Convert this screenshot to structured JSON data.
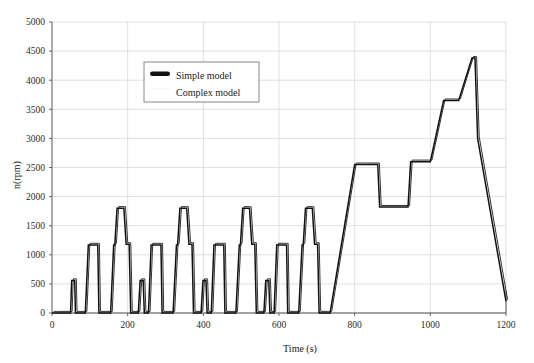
{
  "chart_data": {
    "type": "line",
    "title": "",
    "xlabel": "Time (s)",
    "ylabel": "n(rpm)",
    "xlim": [
      0,
      1200
    ],
    "ylim": [
      0,
      5000
    ],
    "xticks": [
      0,
      200,
      400,
      600,
      800,
      1000,
      1200
    ],
    "yticks": [
      0,
      500,
      1000,
      1500,
      2000,
      2500,
      3000,
      3500,
      4000,
      4500,
      5000
    ],
    "grid": true,
    "legend_position": "upper-left-inside",
    "colors": {
      "simple_model": "#111111",
      "complex_model": "#333333",
      "grid": "#d8d8da",
      "axis": "#555555"
    },
    "series": [
      {
        "name": "Simple model",
        "marker": "thick-line",
        "points": [
          [
            0,
            0
          ],
          [
            10,
            0
          ],
          [
            11,
            0
          ],
          [
            49,
            0
          ],
          [
            52,
            560
          ],
          [
            57,
            560
          ],
          [
            60,
            560
          ],
          [
            62,
            0
          ],
          [
            85,
            0
          ],
          [
            88,
            0
          ],
          [
            96,
            1170
          ],
          [
            118,
            1170
          ],
          [
            121,
            1170
          ],
          [
            124,
            0
          ],
          [
            150,
            0
          ],
          [
            155,
            0
          ],
          [
            163,
            1170
          ],
          [
            166,
            1170
          ],
          [
            172,
            1800
          ],
          [
            186,
            1800
          ],
          [
            190,
            1800
          ],
          [
            196,
            1180
          ],
          [
            200,
            1180
          ],
          [
            204,
            1180
          ],
          [
            208,
            0
          ],
          [
            225,
            0
          ],
          [
            228,
            0
          ],
          [
            233,
            560
          ],
          [
            238,
            560
          ],
          [
            241,
            560
          ],
          [
            244,
            0
          ],
          [
            250,
            0
          ],
          [
            255,
            0
          ],
          [
            262,
            1170
          ],
          [
            284,
            1170
          ],
          [
            288,
            1170
          ],
          [
            291,
            0
          ],
          [
            316,
            0
          ],
          [
            320,
            0
          ],
          [
            329,
            1170
          ],
          [
            332,
            1170
          ],
          [
            338,
            1800
          ],
          [
            352,
            1800
          ],
          [
            356,
            1800
          ],
          [
            362,
            1180
          ],
          [
            366,
            1180
          ],
          [
            370,
            1180
          ],
          [
            374,
            0
          ],
          [
            391,
            0
          ],
          [
            394,
            0
          ],
          [
            399,
            560
          ],
          [
            404,
            560
          ],
          [
            407,
            560
          ],
          [
            410,
            0
          ],
          [
            416,
            0
          ],
          [
            421,
            0
          ],
          [
            428,
            1170
          ],
          [
            450,
            1170
          ],
          [
            454,
            1170
          ],
          [
            457,
            0
          ],
          [
            482,
            0
          ],
          [
            486,
            0
          ],
          [
            495,
            1170
          ],
          [
            498,
            1170
          ],
          [
            504,
            1800
          ],
          [
            518,
            1800
          ],
          [
            522,
            1800
          ],
          [
            528,
            1180
          ],
          [
            532,
            1180
          ],
          [
            536,
            1180
          ],
          [
            540,
            0
          ],
          [
            557,
            0
          ],
          [
            560,
            0
          ],
          [
            565,
            560
          ],
          [
            570,
            560
          ],
          [
            573,
            560
          ],
          [
            576,
            0
          ],
          [
            582,
            0
          ],
          [
            587,
            0
          ],
          [
            594,
            1170
          ],
          [
            616,
            1170
          ],
          [
            620,
            1170
          ],
          [
            623,
            0
          ],
          [
            648,
            0
          ],
          [
            652,
            0
          ],
          [
            661,
            1170
          ],
          [
            664,
            1170
          ],
          [
            670,
            1800
          ],
          [
            684,
            1800
          ],
          [
            688,
            1800
          ],
          [
            694,
            1180
          ],
          [
            698,
            1180
          ],
          [
            702,
            1180
          ],
          [
            706,
            0
          ],
          [
            723,
            0
          ],
          [
            726,
            0
          ],
          [
            735,
            0
          ],
          [
            800,
            2550
          ],
          [
            816,
            2550
          ],
          [
            861,
            2550
          ],
          [
            866,
            1820
          ],
          [
            900,
            1820
          ],
          [
            941,
            1820
          ],
          [
            948,
            2600
          ],
          [
            990,
            2600
          ],
          [
            1000,
            2600
          ],
          [
            1035,
            3650
          ],
          [
            1056,
            3650
          ],
          [
            1075,
            3650
          ],
          [
            1110,
            4380
          ],
          [
            1118,
            4380
          ],
          [
            1125,
            3000
          ],
          [
            1200,
            200
          ]
        ]
      },
      {
        "name": "Complex model",
        "marker": "thin-line",
        "offset_note": "near-identical overlay of Simple model, shifted slightly"
      }
    ],
    "legend": [
      "Simple model",
      "Complex model"
    ]
  },
  "axes": {
    "y_title": "n(rpm)",
    "x_title": "Time (s)"
  }
}
